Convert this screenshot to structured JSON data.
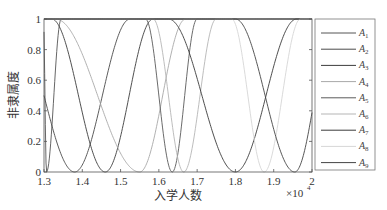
{
  "chart_data": {
    "type": "line",
    "title": "",
    "xlabel": "入学人数",
    "ylabel": "非隶属度",
    "x_multiplier": "×10^4",
    "x_multiplier_base": "×10",
    "x_multiplier_exp": "4",
    "xlim": [
      1.3,
      2.0
    ],
    "ylim": [
      0,
      1
    ],
    "grid": false,
    "legend_position": "right-outside",
    "xticks": [
      "1.3",
      "1.4",
      "1.5",
      "1.6",
      "1.7",
      "1.8",
      "1.9",
      "2"
    ],
    "yticks": [
      "0",
      "0.2",
      "0.4",
      "0.6",
      "0.8",
      "1"
    ],
    "series": [
      {
        "name": "A1",
        "color": "#555555",
        "left": 1.2985,
        "min": 1.3065,
        "right": 1.345,
        "start_value": null
      },
      {
        "name": "A2",
        "color": "#4a4a4a",
        "left": 1.22,
        "min": 1.38,
        "right": 1.525,
        "start_value": 0.6
      },
      {
        "name": "A3",
        "color": "#3c3c3c",
        "left": 1.32,
        "min": 1.46,
        "right": 1.585,
        "start_value": 1
      },
      {
        "name": "A4",
        "color": "#a8a8a8",
        "left": 1.33,
        "min": 1.55,
        "right": 1.67,
        "start_value": 1
      },
      {
        "name": "A5",
        "color": "#5a5a5a",
        "left": 1.565,
        "min": 1.635,
        "right": 1.7,
        "start_value": 1
      },
      {
        "name": "A6",
        "color": "#b5b5b5",
        "left": 1.585,
        "min": 1.665,
        "right": 1.75,
        "start_value": 1
      },
      {
        "name": "A7",
        "color": "#3a3a3a",
        "left": 1.625,
        "min": 1.8,
        "right": 1.96,
        "start_value": 1
      },
      {
        "name": "A8",
        "color": "#d6d6d6",
        "left": 1.79,
        "min": 1.875,
        "right": 1.97,
        "start_value": 1
      },
      {
        "name": "A9",
        "color": "#444444",
        "left": 1.8,
        "min": 1.955,
        "right": 2.06,
        "start_value": 1
      }
    ]
  }
}
